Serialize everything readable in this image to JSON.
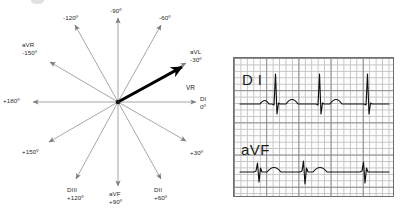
{
  "axis_diagram": {
    "name": "hexaxial-reference-system",
    "center": {
      "x": 118,
      "y": 102
    },
    "mean_vector": {
      "label": "VR",
      "angle_deg": -30,
      "color": "#000000"
    },
    "axes": [
      {
        "id": "di",
        "lead": "DI",
        "degrees": "0º",
        "angle": 0
      },
      {
        "id": "plus30",
        "lead": "",
        "degrees": "+30º",
        "angle": 30
      },
      {
        "id": "dii",
        "lead": "DII",
        "degrees": "+60º",
        "angle": 60
      },
      {
        "id": "avf",
        "lead": "aVF",
        "degrees": "+90º",
        "angle": 90
      },
      {
        "id": "diii",
        "lead": "DIII",
        "degrees": "+120º",
        "angle": 120
      },
      {
        "id": "plus150",
        "lead": "",
        "degrees": "+150º",
        "angle": 150
      },
      {
        "id": "plus180",
        "lead": "",
        "degrees": "+180º",
        "angle": 180
      },
      {
        "id": "avr",
        "lead": "aVR",
        "degrees": "-150º",
        "angle": -150
      },
      {
        "id": "minus120",
        "lead": "",
        "degrees": "-120º",
        "angle": -120
      },
      {
        "id": "minus90",
        "lead": "",
        "degrees": "-90º",
        "angle": -90
      },
      {
        "id": "minus60",
        "lead": "",
        "degrees": "-60º",
        "angle": -60
      },
      {
        "id": "avl",
        "lead": "aVL",
        "degrees": "-30º",
        "angle": -30
      }
    ]
  },
  "ecg_panel": {
    "name": "ecg-strip",
    "grid": {
      "small_mm": 1,
      "large_mm": 5,
      "fine_color": "#c3c3c3",
      "heavy_color": "#8d8d8d"
    },
    "traces": [
      {
        "lead_label": "D I",
        "polarity": "positive",
        "qrs_count": 3
      },
      {
        "lead_label": "aVF",
        "polarity": "negative",
        "qrs_count": 3
      }
    ]
  },
  "colors": {
    "axis_line": "#8a8a8a",
    "vector": "#000000",
    "text": "#2b2b2b",
    "panel_border": "#6e6e6e"
  }
}
